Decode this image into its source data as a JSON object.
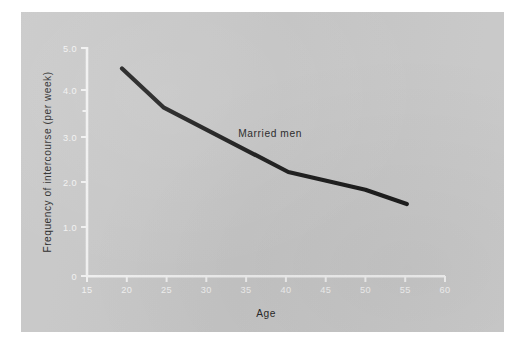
{
  "figure": {
    "background_color": "#ffffff",
    "plate_color": "#c9c9c9",
    "axis_color": "#f2f2f2",
    "line_color": "#1a1a1a",
    "text_color": "#232323"
  },
  "chart_data": {
    "type": "line",
    "title": "",
    "subtitle": "",
    "xlabel": "Age",
    "ylabel": "Frequency of intercourse (per week)",
    "xlim": [
      15,
      60
    ],
    "ylim": [
      0,
      5.0
    ],
    "grid": false,
    "legend_position": "inline-annotation",
    "x_ticks": [
      "15",
      "20",
      "25",
      "30",
      "35",
      "40",
      "45",
      "50",
      "55",
      "60"
    ],
    "x_tick_values": [
      15,
      20,
      25,
      30,
      35,
      40,
      45,
      50,
      55,
      60
    ],
    "y_ticks": [
      "0",
      "1.0",
      "2.0",
      "3.0",
      "4.0",
      "5.0"
    ],
    "y_tick_values": [
      0,
      1.0,
      2.0,
      3.0,
      4.0,
      5.0
    ],
    "annotations": [
      {
        "text": "Married men",
        "x": 34.0,
        "y": 3.05
      }
    ],
    "series": [
      {
        "name": "Married men",
        "color": "#1a1a1a",
        "x": [
          19.4,
          24.6,
          40.3,
          50.0,
          55.2
        ],
        "values": [
          4.55,
          3.7,
          2.28,
          1.89,
          1.58
        ],
        "points": [
          {
            "x": 19.4,
            "y": 4.55
          },
          {
            "x": 24.6,
            "y": 3.7
          },
          {
            "x": 40.3,
            "y": 2.28
          },
          {
            "x": 50.0,
            "y": 1.89
          },
          {
            "x": 55.2,
            "y": 1.58
          }
        ]
      }
    ]
  }
}
